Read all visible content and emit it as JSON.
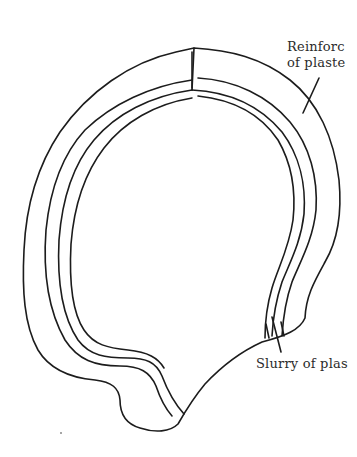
{
  "diagram": {
    "type": "line-drawing",
    "colors": {
      "line": "#1c1c1c",
      "text": "#2b2b2b",
      "background": "#ffffff"
    },
    "labels": [
      {
        "id": "reinforcement",
        "lines": [
          "Reinforc",
          "of plaste"
        ],
        "points_to": "outer shell band"
      },
      {
        "id": "slurry",
        "lines": [
          "Slurry of plas"
        ],
        "points_to": "inner thin layer"
      }
    ]
  }
}
